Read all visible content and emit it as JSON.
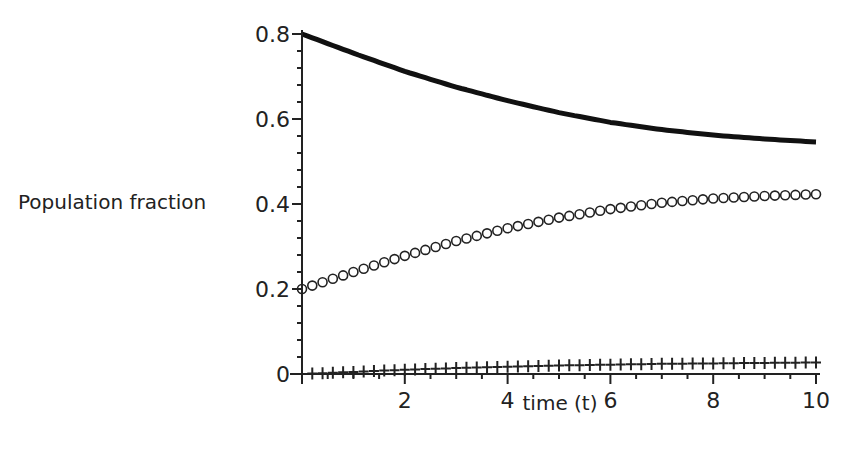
{
  "chart_data": {
    "type": "line",
    "title": "",
    "xlabel": "time (t)",
    "ylabel": "Population fraction",
    "xlim": [
      0,
      10
    ],
    "ylim": [
      0,
      0.8
    ],
    "xticks": [
      2,
      4,
      6,
      8,
      10
    ],
    "yticks": [
      0,
      0.2,
      0.4,
      0.6,
      0.8
    ],
    "xtick_labels": [
      "2",
      "4",
      "6",
      "8",
      "10"
    ],
    "ytick_labels": [
      "0",
      "0.2",
      "0.4",
      "0.6",
      "0.8"
    ],
    "grid": false,
    "legend": null,
    "x": [
      0,
      1,
      2,
      3,
      4,
      5,
      6,
      7,
      8,
      9,
      10
    ],
    "series": [
      {
        "name": "solid-line",
        "style": "solid",
        "values": [
          0.8,
          0.755,
          0.712,
          0.675,
          0.643,
          0.615,
          0.592,
          0.575,
          0.562,
          0.553,
          0.546
        ]
      },
      {
        "name": "circle-markers",
        "style": "circle",
        "values": [
          0.2,
          0.24,
          0.278,
          0.313,
          0.343,
          0.368,
          0.388,
          0.403,
          0.413,
          0.419,
          0.423
        ]
      },
      {
        "name": "cross-markers",
        "style": "cross",
        "values": [
          0.0,
          0.005,
          0.01,
          0.014,
          0.017,
          0.02,
          0.022,
          0.024,
          0.025,
          0.026,
          0.027
        ]
      }
    ]
  }
}
